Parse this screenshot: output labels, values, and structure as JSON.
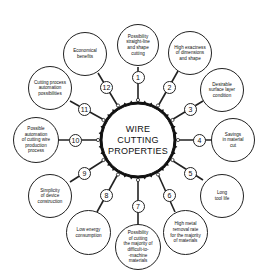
{
  "hub": {
    "title": "WIRE\nCUTTING\nPROPERTIES"
  },
  "properties": [
    {
      "num": "1",
      "text": "Possibility\nstraight-line\nand shape\ncutting"
    },
    {
      "num": "2",
      "text": "High exactness\nof dimensions\nand shape"
    },
    {
      "num": "3",
      "text": "Desirable\nsurface layer\ncondition"
    },
    {
      "num": "4",
      "text": "Savings\nin material\ncut"
    },
    {
      "num": "5",
      "text": "Long\ntool life"
    },
    {
      "num": "6",
      "text": "High metal\nremoval rate\nfor the majority\nof materials"
    },
    {
      "num": "7",
      "text": "Possibility\nof cutting\nthe majority of\ndifficult-to-\n-machine\nmaterials"
    },
    {
      "num": "8",
      "text": "Low energy\nconsumption"
    },
    {
      "num": "9",
      "text": "Simplicity\nof device\nconstruction"
    },
    {
      "num": "10",
      "text": "Possible\nautomation\nof cutting wire\nproduction\nprocess"
    },
    {
      "num": "11",
      "text": "Cutting process\nautomation\npossibilities"
    },
    {
      "num": "12",
      "text": "Economical\nbenefits"
    }
  ],
  "colors": {
    "stroke": "#222222",
    "background": "#ffffff"
  }
}
